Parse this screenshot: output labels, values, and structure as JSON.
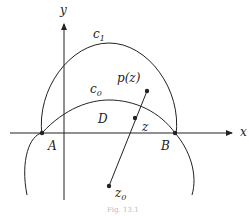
{
  "diagram": {
    "axes": {
      "x_label": "x",
      "y_label": "y"
    },
    "curves": [
      {
        "name": "c",
        "subscript": "1",
        "description": "upper arc through A and B"
      },
      {
        "name": "c",
        "subscript": "0",
        "description": "circle arc through A and B"
      }
    ],
    "points": [
      {
        "label": "A",
        "subscript": ""
      },
      {
        "label": "B",
        "subscript": ""
      },
      {
        "label": "z",
        "subscript": ""
      },
      {
        "label": "z",
        "subscript": "0"
      },
      {
        "label": "p(z)",
        "subscript": ""
      }
    ],
    "region_label": "D",
    "caption": "Fig. 13.1",
    "colors": {
      "stroke": "#222222",
      "background": "#ffffff"
    }
  }
}
